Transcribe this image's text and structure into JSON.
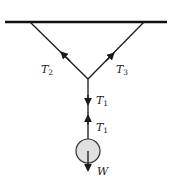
{
  "diagram": {
    "type": "free-body / tension diagram",
    "ceiling": {
      "x1": 5,
      "x2": 167,
      "y": 22
    },
    "junction": {
      "x": 88,
      "y": 79
    },
    "ropes": [
      {
        "name": "left-rope",
        "from": [
          30,
          22
        ],
        "to": [
          88,
          79
        ],
        "label": "T",
        "subscript": "2"
      },
      {
        "name": "right-rope",
        "from": [
          144,
          22
        ],
        "to": [
          88,
          79
        ],
        "label": "T",
        "subscript": "3"
      },
      {
        "name": "vertical-rope",
        "from": [
          88,
          79
        ],
        "to": [
          88,
          139
        ]
      }
    ],
    "labels": {
      "t2": {
        "main": "T",
        "sub": "2"
      },
      "t3": {
        "main": "T",
        "sub": "3"
      },
      "t1_upper": {
        "main": "T",
        "sub": "1"
      },
      "t1_lower": {
        "main": "T",
        "sub": "1"
      },
      "w": {
        "main": "W"
      }
    },
    "mass": {
      "cx": 88,
      "cy": 151,
      "r": 12,
      "fill": "#e0e0e0",
      "stroke": "#333333"
    },
    "colors": {
      "line": "#1a1a1a",
      "ceiling": "#111111"
    }
  }
}
